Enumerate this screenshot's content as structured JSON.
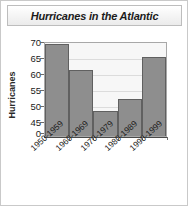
{
  "chart_data": {
    "type": "bar",
    "title": "Hurricanes in the Atlantic",
    "xlabel": "",
    "ylabel": "Hurricanes",
    "categories": [
      "1950-1959",
      "1960-1969",
      "1970-1979",
      "1980-1989",
      "1990-1999"
    ],
    "values": [
      69,
      61,
      48,
      52,
      65
    ],
    "ylim": [
      45,
      70
    ],
    "yticks": [
      70,
      65,
      60,
      55,
      50,
      45,
      0
    ],
    "axis_break": true,
    "grid": true,
    "legend": "none",
    "bar_color": "#8e8e8e",
    "bar_edge_color": "#606060",
    "plot_background": "#f7f7f7",
    "gridline_color": "#dcdcdc",
    "text_color": "#1b1b1b"
  }
}
